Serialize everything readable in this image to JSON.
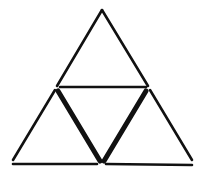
{
  "diagram": {
    "type": "matchstick-puzzle",
    "colors": {
      "stick": "#111111",
      "background": "#ffffff"
    },
    "sticks": [
      {
        "id": "top-left",
        "x1": 102,
        "y1": 10,
        "x2": 57,
        "y2": 86,
        "bold": false
      },
      {
        "id": "top-right",
        "x1": 102,
        "y1": 10,
        "x2": 148,
        "y2": 86,
        "bold": false
      },
      {
        "id": "middle",
        "x1": 60,
        "y1": 87,
        "x2": 146,
        "y2": 87,
        "bold": false
      },
      {
        "id": "lower-left",
        "x1": 55,
        "y1": 90,
        "x2": 13,
        "y2": 160,
        "bold": false
      },
      {
        "id": "inner-left",
        "x1": 58,
        "y1": 91,
        "x2": 100,
        "y2": 161,
        "bold": true
      },
      {
        "id": "inner-right",
        "x1": 146,
        "y1": 91,
        "x2": 104,
        "y2": 161,
        "bold": true
      },
      {
        "id": "lower-right",
        "x1": 150,
        "y1": 90,
        "x2": 192,
        "y2": 160,
        "bold": false
      },
      {
        "id": "bottom-left",
        "x1": 13,
        "y1": 164,
        "x2": 97,
        "y2": 164,
        "bold": false
      },
      {
        "id": "bottom-right",
        "x1": 106,
        "y1": 164,
        "x2": 192,
        "y2": 165,
        "bold": false
      }
    ]
  }
}
